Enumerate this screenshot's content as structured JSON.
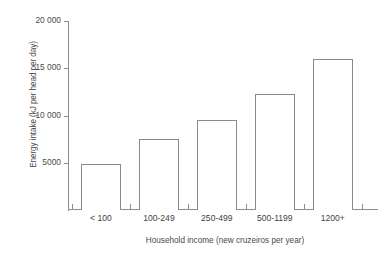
{
  "chart_data": {
    "type": "bar",
    "title": "",
    "xlabel": "Household income (new cruzeiros per year)",
    "ylabel": "Energy intake (kJ per head per day)",
    "categories": [
      "< 100",
      "100-249",
      "250-499",
      "500-1199",
      "1200+"
    ],
    "values": [
      4900,
      7500,
      9500,
      12300,
      16000
    ],
    "ylim": [
      0,
      20000
    ],
    "yticks": [
      0,
      5000,
      10000,
      15000,
      20000
    ],
    "ytick_labels": [
      "",
      "5000",
      "10 000",
      "15 000",
      "20 000"
    ],
    "grid": false,
    "legend": "none",
    "series": [
      {
        "name": "Energy intake",
        "values": [
          4900,
          7500,
          9500,
          12300,
          16000
        ]
      }
    ],
    "bar_style": {
      "fill": "#ffffff",
      "stroke": "#8a8a8a"
    },
    "axis_color": "#8d8d8d",
    "text_color": "#3f3f3f",
    "background": "#ffffff"
  }
}
